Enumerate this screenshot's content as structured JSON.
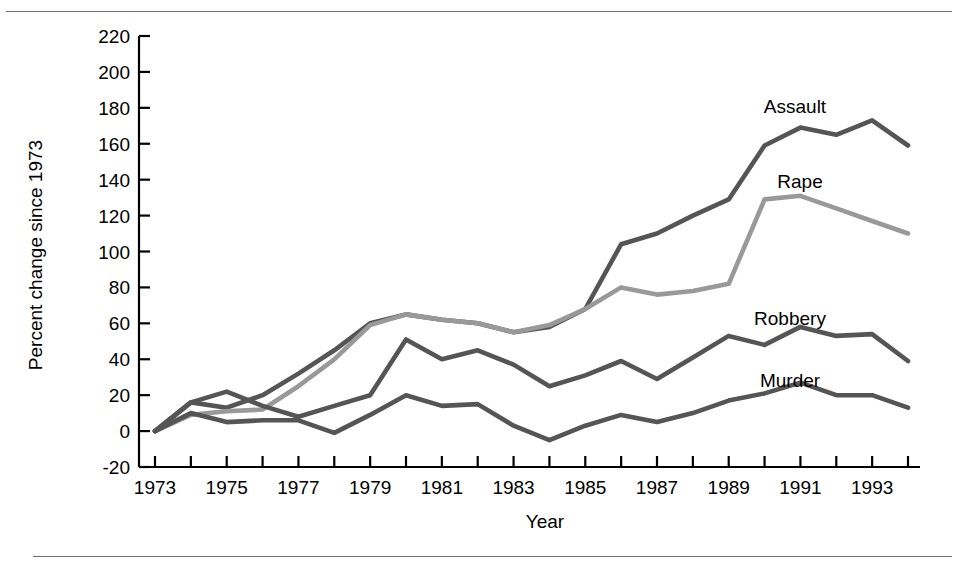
{
  "chart_data": {
    "type": "line",
    "title": "",
    "xlabel": "Year",
    "ylabel": "Percent change since 1973",
    "xlim": [
      1973,
      1994
    ],
    "ylim": [
      -20,
      220
    ],
    "grid": false,
    "legend_position": "inline-right-of-series",
    "x": [
      1973,
      1974,
      1975,
      1976,
      1977,
      1978,
      1979,
      1980,
      1981,
      1982,
      1983,
      1984,
      1985,
      1986,
      1987,
      1988,
      1989,
      1990,
      1991,
      1992,
      1993,
      1994
    ],
    "xticks": [
      1973,
      1975,
      1977,
      1979,
      1981,
      1983,
      1985,
      1987,
      1989,
      1991,
      1993
    ],
    "xtick_labels": [
      "1973",
      "1975",
      "1977",
      "1979",
      "1981",
      "1983",
      "1985",
      "1987",
      "1989",
      "1991",
      "1993"
    ],
    "yticks": [
      -20,
      0,
      20,
      40,
      60,
      80,
      100,
      120,
      140,
      160,
      180,
      200,
      220
    ],
    "ytick_labels": [
      "-20",
      "0",
      "20",
      "40",
      "60",
      "80",
      "100",
      "120",
      "140",
      "160",
      "180",
      "200",
      "220"
    ],
    "series": [
      {
        "name": "Assault",
        "label": "Assault",
        "color": "#555555",
        "values": [
          0,
          16,
          13,
          20,
          32,
          45,
          60,
          65,
          62,
          60,
          55,
          58,
          68,
          104,
          110,
          120,
          129,
          159,
          169,
          165,
          173,
          159
        ]
      },
      {
        "name": "Rape",
        "label": "Rape",
        "color": "#999999",
        "values": [
          0,
          9,
          11,
          12,
          25,
          40,
          59,
          65,
          62,
          60,
          55,
          59,
          68,
          80,
          76,
          78,
          82,
          129,
          131,
          124,
          117,
          110
        ]
      },
      {
        "name": "Robbery",
        "label": "Robbery",
        "color": "#555555",
        "values": [
          0,
          16,
          22,
          14,
          8,
          14,
          20,
          51,
          40,
          45,
          37,
          25,
          31,
          39,
          29,
          41,
          53,
          48,
          58,
          53,
          54,
          39
        ]
      },
      {
        "name": "Murder",
        "label": "Murder",
        "color": "#555555",
        "values": [
          0,
          10,
          5,
          6,
          6,
          -1,
          9,
          20,
          14,
          15,
          3,
          -5,
          3,
          9,
          5,
          10,
          17,
          21,
          27,
          20,
          20,
          13
        ]
      }
    ]
  },
  "axis": {
    "x_title": "Year",
    "y_title": "Percent change since 1973"
  }
}
